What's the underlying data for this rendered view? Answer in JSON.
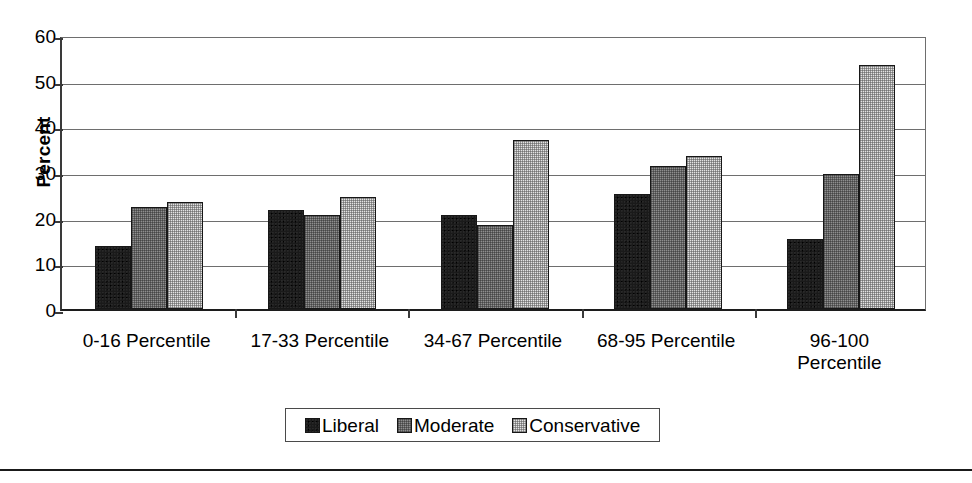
{
  "chart_data": {
    "type": "bar",
    "title": "",
    "xlabel": "",
    "ylabel": "Percent",
    "ylim": [
      0,
      60
    ],
    "ytick_step": 10,
    "yticks": [
      0,
      10,
      20,
      30,
      40,
      50,
      60
    ],
    "grid": true,
    "legend_position": "bottom",
    "categories": [
      "0-16 Percentile",
      "17-33 Percentile",
      "34-67 Percentile",
      "68-95 Percentile",
      "96-100\nPercentile"
    ],
    "series": [
      {
        "name": "Liberal",
        "color": "#1a1a1a",
        "values": [
          13.9,
          21.6,
          20.5,
          25.2,
          15.4
        ]
      },
      {
        "name": "Moderate",
        "color": "#8f8f8f",
        "values": [
          22.4,
          20.6,
          18.4,
          31.4,
          29.5
        ]
      },
      {
        "name": "Conservative",
        "color": "#e3e3e3",
        "values": [
          23.4,
          24.6,
          37.0,
          33.4,
          53.5
        ]
      }
    ]
  },
  "axis": {
    "y_title": "Percent",
    "tick_labels": [
      "60",
      "50",
      "40",
      "30",
      "20",
      "10",
      "0"
    ]
  },
  "legend": {
    "items": [
      {
        "label": "Liberal"
      },
      {
        "label": "Moderate"
      },
      {
        "label": "Conservative"
      }
    ]
  }
}
